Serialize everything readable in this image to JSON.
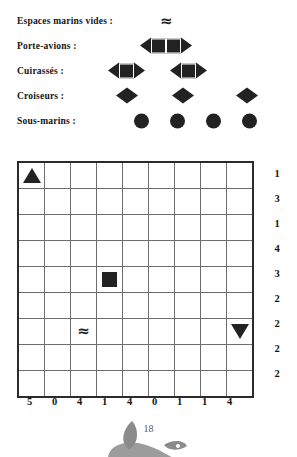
{
  "legend": {
    "rows": [
      {
        "label": "Espaces marins vides :",
        "icon": "wave-icon",
        "ship_kind": "empty-sea",
        "count": 1,
        "pieces": [
          "wave"
        ],
        "x_offsets": [
          50
        ]
      },
      {
        "label": "Porte-avions :",
        "icon": "carrier-icon",
        "ship_kind": "aircraft-carrier",
        "count": 1,
        "pieces": [
          "bow",
          "mid",
          "mid",
          "stern"
        ],
        "x_offsets": [
          30
        ]
      },
      {
        "label": "Cuirassés :",
        "icon": "battleship-icon",
        "ship_kind": "battleship",
        "count": 2,
        "pieces": [
          "bow",
          "mid",
          "stern"
        ],
        "x_offsets": [
          -2,
          60
        ]
      },
      {
        "label": "Croiseurs :",
        "icon": "cruiser-icon",
        "ship_kind": "cruiser",
        "count": 3,
        "pieces": [
          "bow",
          "stern"
        ],
        "x_offsets": [
          6,
          62,
          126
        ]
      },
      {
        "label": "Sous-marins :",
        "icon": "submarine-icon",
        "ship_kind": "submarine",
        "count": 4,
        "pieces": [
          "sub"
        ],
        "x_offsets": [
          24,
          60,
          96,
          132
        ]
      }
    ]
  },
  "grid": {
    "rows": 9,
    "cols": 9,
    "marks": [
      {
        "row": 1,
        "col": 1,
        "type": "triangle-up",
        "name": "mark-triangle-up"
      },
      {
        "row": 5,
        "col": 4,
        "type": "square",
        "name": "mark-square"
      },
      {
        "row": 7,
        "col": 3,
        "type": "wave",
        "name": "mark-wave"
      },
      {
        "row": 7,
        "col": 9,
        "type": "triangle-down",
        "name": "mark-triangle-down"
      }
    ],
    "row_clues": [
      1,
      3,
      1,
      4,
      3,
      2,
      2,
      2,
      2
    ],
    "col_clues": [
      5,
      0,
      4,
      1,
      4,
      0,
      1,
      1,
      4
    ]
  },
  "footer": {
    "page_number": "18",
    "ornament": "leaf-apple-ornament"
  },
  "colors": {
    "ink": "#222222",
    "text": "#141414",
    "grid_line": "#6d6d6d",
    "grid_border": "#2b2b2b",
    "ornament": "#8b8b8b",
    "page_number": "#5a5a5a",
    "background": "#ffffff"
  }
}
